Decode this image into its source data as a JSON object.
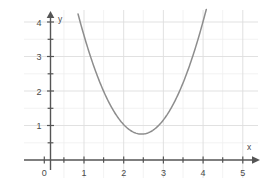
{
  "figure": {
    "title": "",
    "background_color": "#ffffff",
    "grid_color": "#e4e4e4",
    "axis_color": "#555555",
    "curve_color": "#8d8d8d",
    "label_color": "#4a4a4a"
  },
  "axes": {
    "x_axis_label": "x",
    "y_axis_label": "y",
    "x_ticks": [
      "0",
      "1",
      "2",
      "3",
      "4",
      "5"
    ],
    "y_ticks": [
      "1",
      "2",
      "3",
      "4"
    ],
    "origin_label": "0"
  },
  "chart_data": {
    "type": "line",
    "title": "",
    "xlabel": "x",
    "ylabel": "y",
    "xlim": [
      0,
      5
    ],
    "ylim": [
      0,
      4.3
    ],
    "grid": true,
    "grid_minor_step": 0.5,
    "grid_major_step": 1,
    "legend": "none",
    "curve": {
      "name": "parabola",
      "equation": "y = 1.36(x - 2.45)^2 + 0.75",
      "vertex": [
        2.45,
        0.75
      ],
      "a": 1.36,
      "x_start": 0.85,
      "x_end": 4.08,
      "x": [
        0.85,
        1.0,
        1.2,
        1.4,
        1.6,
        1.8,
        2.0,
        2.2,
        2.45,
        2.6,
        2.8,
        3.0,
        3.2,
        3.4,
        3.6,
        3.8,
        4.0,
        4.08
      ],
      "y": [
        4.19,
        3.57,
        2.85,
        2.24,
        1.73,
        1.33,
        1.03,
        0.83,
        0.75,
        0.78,
        0.92,
        1.15,
        1.5,
        1.95,
        2.5,
        3.15,
        3.9,
        4.23
      ]
    }
  }
}
